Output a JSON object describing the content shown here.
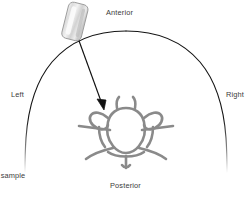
{
  "diagram": {
    "title_visible": false,
    "type": "axial cross-section schematic of torso with vertebra and biopsy needle",
    "labels": {
      "anterior": "Anterior",
      "posterior": "Posterior",
      "left": "Left",
      "right": "Right",
      "sample": "ry sample"
    },
    "colors": {
      "outline": "#1a1a1a",
      "bone_stroke": "#8a8a8a",
      "bone_stroke_dark": "#6f6f6f",
      "bone_fill": "#ffffff",
      "needle": "#111111",
      "probe_body": "#e8e8e8",
      "probe_edge": "#9a9a9a",
      "text": "#3b3b3b",
      "background": "#ffffff"
    },
    "elements": {
      "body_outline": "open dome arc representing torso in axial section",
      "probe": "rounded rectangle transducer / needle guide, tilted",
      "needle": "straight line with arrowhead from probe to vertebra",
      "vertebra": "vertebral cross-section with body, pedicles, transverse processes, spinous process"
    }
  }
}
